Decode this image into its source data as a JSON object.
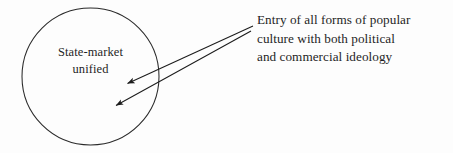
{
  "diagram": {
    "type": "annotated-circle-diagram",
    "background_color": "#fdfdfd",
    "stroke_color": "#222222",
    "text_color": "#1f1f1f",
    "circle": {
      "name": "state-market-circle",
      "center_x": 90.5,
      "center_y": 76.5,
      "radius": 68.5,
      "label_lines": [
        "State-market",
        "unified"
      ],
      "label_line_1": "State-market",
      "label_line_2": "unified"
    },
    "annotation": {
      "name": "entry-annotation",
      "lines": [
        "Entry of all forms of popular",
        "culture with both political",
        "and commercial ideology"
      ],
      "line_1": "Entry of all forms of popular",
      "line_2": "culture with both political",
      "line_3": "and commercial ideology"
    },
    "arrows": [
      {
        "name": "arrow-upper",
        "from_x": 253,
        "from_y": 26,
        "to_x": 124,
        "to_y": 85,
        "arrowhead": "solid-triangle"
      },
      {
        "name": "arrow-lower",
        "from_x": 251,
        "from_y": 31,
        "to_x": 112,
        "to_y": 107,
        "arrowhead": "solid-triangle"
      }
    ]
  }
}
